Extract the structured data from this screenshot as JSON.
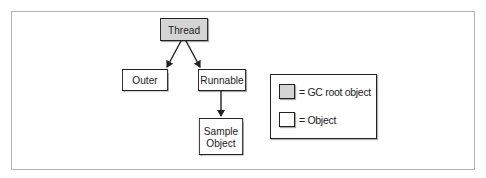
{
  "diagram": {
    "nodes": {
      "thread": {
        "label": "Thread",
        "type": "gc-root"
      },
      "outer": {
        "label": "Outer",
        "type": "object"
      },
      "runnable": {
        "label": "Runnable",
        "type": "object"
      },
      "sample_object": {
        "label_line1": "Sample",
        "label_line2": "Object",
        "type": "object"
      }
    },
    "edges": [
      {
        "from": "Thread",
        "to": "Outer"
      },
      {
        "from": "Thread",
        "to": "Runnable"
      },
      {
        "from": "Runnable",
        "to": "Sample Object"
      }
    ],
    "legend": {
      "items": [
        {
          "label": "= GC root object",
          "color": "#d4d4d4"
        },
        {
          "label": "= Object",
          "color": "#ffffff"
        }
      ]
    }
  }
}
